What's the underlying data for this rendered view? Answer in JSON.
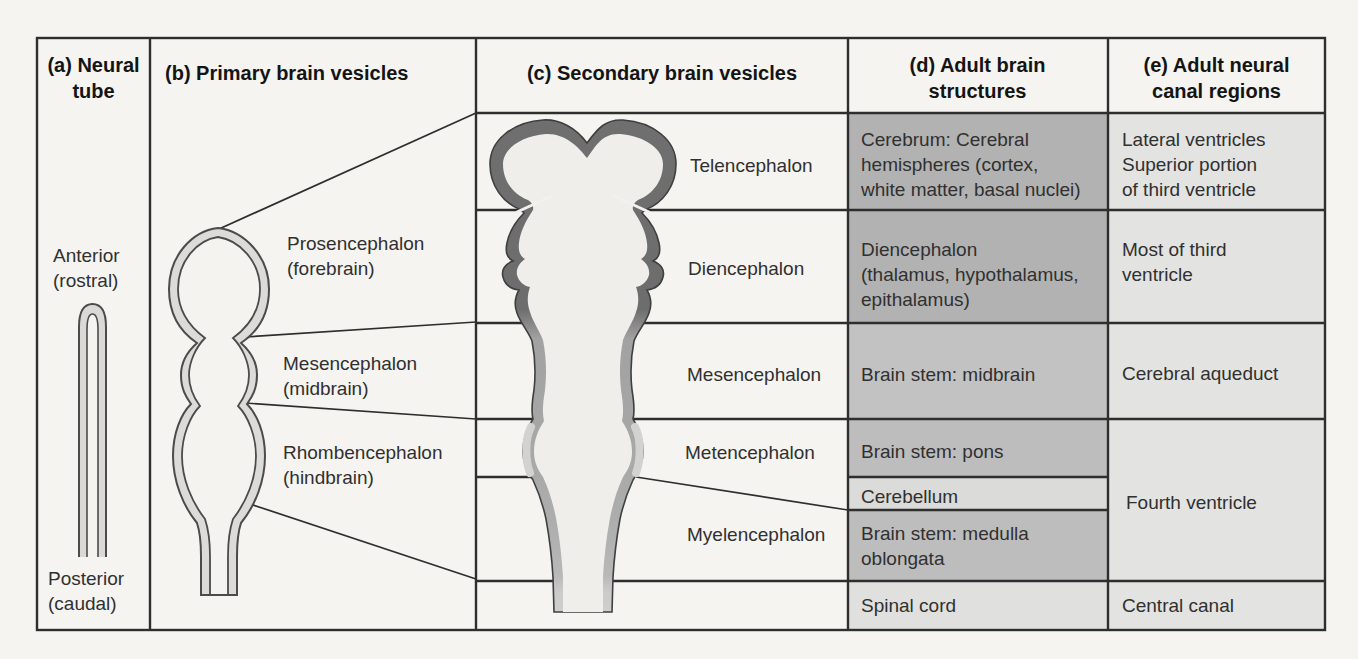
{
  "figure_type": "brain development table diagram",
  "colors": {
    "paper": "#f5f4f0",
    "grid_line": "#2e2e2e",
    "cell_gray_dark": "#b2b2b2",
    "cell_gray_mid": "#bdbdbd",
    "cell_gray_midlight": "#c2c2c2",
    "cell_gray_light": "#dbdbd9",
    "cell_gray_column_e": "#e3e3e1",
    "vesicle_wall_dark": "#6f6f6f",
    "vesicle_wall_mid": "#a6a6a6",
    "vesicle_wall_light": "#cfcfcf",
    "vesicle_interior": "#efeeeb"
  },
  "columns": {
    "a": {
      "header": "(a) Neural\ntube",
      "anterior_label": "Anterior\n(rostral)",
      "posterior_label": "Posterior\n(caudal)"
    },
    "b": {
      "header": "(b) Primary brain vesicles",
      "labels": [
        "Prosencephalon\n(forebrain)",
        "Mesencephalon\n(midbrain)",
        "Rhombencephalon\n(hindbrain)"
      ]
    },
    "c": {
      "header": "(c) Secondary brain vesicles",
      "labels": [
        "Telencephalon",
        "Diencephalon",
        "Mesencephalon",
        "Metencephalon",
        "Myelencephalon"
      ]
    },
    "d": {
      "header": "(d) Adult brain\nstructures",
      "cells": [
        "Cerebrum: Cerebral\nhemispheres (cortex,\nwhite matter, basal nuclei)",
        "Diencephalon\n(thalamus, hypothalamus,\nepithalamus)",
        "Brain stem: midbrain",
        "Brain stem: pons",
        "Cerebellum",
        "Brain stem: medulla\noblongata",
        "Spinal cord"
      ]
    },
    "e": {
      "header": "(e) Adult neural\ncanal regions",
      "cells": [
        "Lateral ventricles\nSuperior portion\nof third ventricle",
        "Most of third\nventricle",
        "Cerebral aqueduct",
        "Fourth ventricle",
        "Central canal"
      ]
    }
  }
}
